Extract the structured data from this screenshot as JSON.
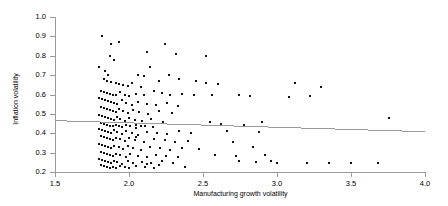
{
  "chart_data": {
    "type": "scatter",
    "title": "",
    "xlabel": "Manufacturing growth volatility",
    "ylabel": "Inflation volatility",
    "xlim": [
      1.5,
      4.0
    ],
    "ylim": [
      0.2,
      1.0
    ],
    "xticks": [
      "1.5",
      "2.0",
      "2.5",
      "3.0",
      "3.5",
      "4.0"
    ],
    "xtick_values": [
      1.5,
      2.0,
      2.5,
      3.0,
      3.5,
      4.0
    ],
    "yticks": [
      "0.2",
      "0.3",
      "0.4",
      "0.5",
      "0.6",
      "0.7",
      "0.8",
      "0.9",
      "1.0"
    ],
    "ytick_values": [
      0.2,
      0.3,
      0.4,
      0.5,
      0.6,
      0.7,
      0.8,
      0.9,
      1.0
    ],
    "grid": false,
    "legend": "none",
    "marker_color": "#111111",
    "axis_color": "#9a9a9a",
    "trendline": {
      "type": "linear",
      "color": "#9a9a9a",
      "x_start": 1.5,
      "y_start": 0.465,
      "x_end": 4.0,
      "y_end": 0.408
    },
    "points": [
      [
        1.82,
        0.9
      ],
      [
        1.88,
        0.86
      ],
      [
        1.93,
        0.87
      ],
      [
        1.87,
        0.8
      ],
      [
        2.24,
        0.86
      ],
      [
        2.32,
        0.81
      ],
      [
        2.52,
        0.8
      ],
      [
        2.12,
        0.82
      ],
      [
        1.9,
        0.78
      ],
      [
        1.8,
        0.74
      ],
      [
        1.84,
        0.72
      ],
      [
        1.86,
        0.7
      ],
      [
        1.83,
        0.68
      ],
      [
        1.85,
        0.67
      ],
      [
        1.88,
        0.665
      ],
      [
        1.91,
        0.66
      ],
      [
        1.93,
        0.655
      ],
      [
        1.96,
        0.65
      ],
      [
        1.99,
        0.645
      ],
      [
        2.02,
        0.66
      ],
      [
        2.08,
        0.64
      ],
      [
        2.14,
        0.74
      ],
      [
        2.2,
        0.67
      ],
      [
        2.27,
        0.7
      ],
      [
        2.34,
        0.68
      ],
      [
        2.45,
        0.67
      ],
      [
        2.52,
        0.66
      ],
      [
        2.6,
        0.655
      ],
      [
        3.12,
        0.66
      ],
      [
        3.3,
        0.64
      ],
      [
        2.06,
        0.7
      ],
      [
        2.1,
        0.695
      ],
      [
        1.81,
        0.62
      ],
      [
        1.83,
        0.615
      ],
      [
        1.85,
        0.61
      ],
      [
        1.87,
        0.605
      ],
      [
        1.89,
        0.6
      ],
      [
        1.91,
        0.595
      ],
      [
        1.94,
        0.615
      ],
      [
        1.97,
        0.6
      ],
      [
        2.0,
        0.59
      ],
      [
        2.05,
        0.605
      ],
      [
        2.1,
        0.6
      ],
      [
        2.17,
        0.62
      ],
      [
        2.22,
        0.61
      ],
      [
        2.28,
        0.6
      ],
      [
        2.36,
        0.605
      ],
      [
        2.44,
        0.595
      ],
      [
        2.56,
        0.6
      ],
      [
        2.74,
        0.595
      ],
      [
        2.82,
        0.59
      ],
      [
        3.08,
        0.585
      ],
      [
        3.22,
        0.59
      ],
      [
        1.8,
        0.58
      ],
      [
        1.82,
        0.575
      ],
      [
        1.84,
        0.57
      ],
      [
        1.86,
        0.565
      ],
      [
        1.88,
        0.56
      ],
      [
        1.9,
        0.555
      ],
      [
        1.92,
        0.55
      ],
      [
        1.95,
        0.57
      ],
      [
        1.98,
        0.555
      ],
      [
        2.02,
        0.545
      ],
      [
        2.06,
        0.56
      ],
      [
        2.12,
        0.55
      ],
      [
        2.18,
        0.545
      ],
      [
        2.26,
        0.555
      ],
      [
        2.33,
        0.54
      ],
      [
        1.81,
        0.535
      ],
      [
        1.83,
        0.53
      ],
      [
        1.85,
        0.525
      ],
      [
        1.87,
        0.52
      ],
      [
        1.89,
        0.515
      ],
      [
        1.91,
        0.51
      ],
      [
        1.93,
        0.525
      ],
      [
        1.96,
        0.515
      ],
      [
        1.99,
        0.505
      ],
      [
        2.03,
        0.52
      ],
      [
        2.07,
        0.51
      ],
      [
        2.13,
        0.5
      ],
      [
        2.2,
        0.515
      ],
      [
        2.29,
        0.505
      ],
      [
        1.8,
        0.495
      ],
      [
        1.82,
        0.49
      ],
      [
        1.84,
        0.485
      ],
      [
        1.86,
        0.48
      ],
      [
        1.88,
        0.475
      ],
      [
        1.9,
        0.47
      ],
      [
        1.92,
        0.485
      ],
      [
        1.94,
        0.475
      ],
      [
        1.97,
        0.465
      ],
      [
        2.0,
        0.48
      ],
      [
        2.04,
        0.47
      ],
      [
        2.09,
        0.465
      ],
      [
        2.15,
        0.475
      ],
      [
        2.23,
        0.46
      ],
      [
        1.81,
        0.455
      ],
      [
        1.83,
        0.45
      ],
      [
        1.85,
        0.445
      ],
      [
        1.87,
        0.44
      ],
      [
        1.89,
        0.435
      ],
      [
        1.91,
        0.445
      ],
      [
        1.93,
        0.44
      ],
      [
        1.95,
        0.43
      ],
      [
        1.98,
        0.445
      ],
      [
        2.01,
        0.435
      ],
      [
        2.05,
        0.425
      ],
      [
        2.11,
        0.44
      ],
      [
        2.16,
        0.43
      ],
      [
        2.05,
        0.445
      ],
      [
        2.08,
        0.435
      ],
      [
        2.55,
        0.46
      ],
      [
        2.62,
        0.45
      ],
      [
        2.78,
        0.445
      ],
      [
        2.9,
        0.46
      ],
      [
        3.76,
        0.48
      ],
      [
        1.8,
        0.42
      ],
      [
        1.82,
        0.415
      ],
      [
        1.84,
        0.41
      ],
      [
        1.86,
        0.405
      ],
      [
        1.88,
        0.4
      ],
      [
        1.9,
        0.415
      ],
      [
        1.92,
        0.405
      ],
      [
        1.95,
        0.395
      ],
      [
        1.98,
        0.41
      ],
      [
        2.02,
        0.4
      ],
      [
        2.06,
        0.39
      ],
      [
        2.12,
        0.405
      ],
      [
        2.19,
        0.4
      ],
      [
        2.26,
        0.395
      ],
      [
        2.34,
        0.41
      ],
      [
        2.42,
        0.4
      ],
      [
        2.66,
        0.41
      ],
      [
        2.88,
        0.405
      ],
      [
        1.81,
        0.385
      ],
      [
        1.83,
        0.38
      ],
      [
        1.85,
        0.375
      ],
      [
        1.87,
        0.37
      ],
      [
        1.89,
        0.365
      ],
      [
        1.91,
        0.375
      ],
      [
        1.94,
        0.37
      ],
      [
        1.97,
        0.36
      ],
      [
        2.0,
        0.375
      ],
      [
        2.04,
        0.365
      ],
      [
        2.1,
        0.355
      ],
      [
        2.17,
        0.37
      ],
      [
        2.24,
        0.365
      ],
      [
        2.31,
        0.355
      ],
      [
        2.4,
        0.36
      ],
      [
        2.7,
        0.355
      ],
      [
        2.05,
        0.38
      ],
      [
        1.8,
        0.345
      ],
      [
        1.82,
        0.34
      ],
      [
        1.84,
        0.335
      ],
      [
        1.86,
        0.33
      ],
      [
        1.88,
        0.325
      ],
      [
        1.9,
        0.335
      ],
      [
        1.93,
        0.33
      ],
      [
        1.96,
        0.32
      ],
      [
        1.99,
        0.335
      ],
      [
        2.03,
        0.325
      ],
      [
        2.08,
        0.315
      ],
      [
        2.14,
        0.33
      ],
      [
        2.21,
        0.325
      ],
      [
        2.28,
        0.315
      ],
      [
        2.36,
        0.325
      ],
      [
        2.47,
        0.32
      ],
      [
        2.84,
        0.33
      ],
      [
        1.81,
        0.305
      ],
      [
        1.83,
        0.3
      ],
      [
        1.85,
        0.295
      ],
      [
        1.87,
        0.29
      ],
      [
        1.89,
        0.285
      ],
      [
        1.91,
        0.295
      ],
      [
        1.94,
        0.29
      ],
      [
        1.98,
        0.28
      ],
      [
        2.01,
        0.295
      ],
      [
        2.06,
        0.285
      ],
      [
        2.12,
        0.275
      ],
      [
        2.18,
        0.29
      ],
      [
        2.25,
        0.285
      ],
      [
        2.33,
        0.275
      ],
      [
        2.58,
        0.29
      ],
      [
        2.72,
        0.285
      ],
      [
        2.92,
        0.29
      ],
      [
        1.8,
        0.265
      ],
      [
        1.82,
        0.26
      ],
      [
        1.84,
        0.255
      ],
      [
        1.86,
        0.25
      ],
      [
        1.88,
        0.245
      ],
      [
        1.9,
        0.255
      ],
      [
        1.92,
        0.25
      ],
      [
        1.95,
        0.24
      ],
      [
        1.99,
        0.255
      ],
      [
        2.03,
        0.245
      ],
      [
        2.09,
        0.25
      ],
      [
        2.15,
        0.245
      ],
      [
        2.22,
        0.255
      ],
      [
        2.3,
        0.245
      ],
      [
        2.38,
        0.225
      ],
      [
        1.81,
        0.235
      ],
      [
        1.83,
        0.23
      ],
      [
        1.85,
        0.225
      ],
      [
        1.87,
        0.22
      ],
      [
        1.89,
        0.228
      ],
      [
        1.91,
        0.222
      ],
      [
        1.94,
        0.232
      ],
      [
        1.97,
        0.226
      ],
      [
        2.0,
        0.22
      ],
      [
        2.05,
        0.23
      ],
      [
        2.11,
        0.225
      ],
      [
        2.17,
        0.222
      ],
      [
        2.2,
        0.235
      ],
      [
        2.12,
        0.24
      ],
      [
        3.0,
        0.245
      ],
      [
        3.2,
        0.245
      ],
      [
        3.35,
        0.245
      ],
      [
        3.5,
        0.245
      ],
      [
        3.68,
        0.245
      ],
      [
        2.86,
        0.25
      ],
      [
        2.74,
        0.255
      ],
      [
        2.96,
        0.255
      ]
    ]
  }
}
